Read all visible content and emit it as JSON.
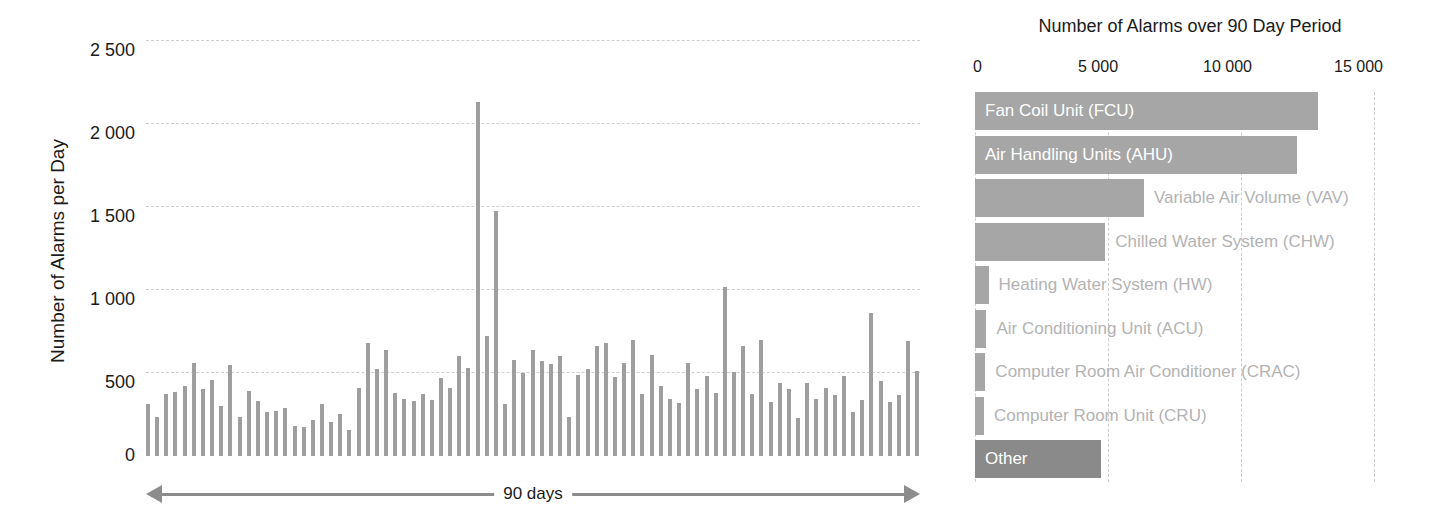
{
  "chart_data": [
    {
      "type": "bar",
      "id": "alarms-per-day",
      "title": "",
      "xlabel": "90 days",
      "ylabel": "Number of Alarms per Day",
      "ylim": [
        0,
        2500
      ],
      "yticks": [
        "0",
        "500",
        "1 000",
        "1 500",
        "2 000",
        "2 500"
      ],
      "ytick_values": [
        0,
        500,
        1000,
        1500,
        2000,
        2500
      ],
      "grid": "horizontal-dashed",
      "legend": "none",
      "bar_color": "#9e9e9e",
      "n_categories": 90,
      "categories": [
        "1",
        "2",
        "3",
        "4",
        "5",
        "6",
        "7",
        "8",
        "9",
        "10",
        "11",
        "12",
        "13",
        "14",
        "15",
        "16",
        "17",
        "18",
        "19",
        "20",
        "21",
        "22",
        "23",
        "24",
        "25",
        "26",
        "27",
        "28",
        "29",
        "30",
        "31",
        "32",
        "33",
        "34",
        "35",
        "36",
        "37",
        "38",
        "39",
        "40",
        "41",
        "42",
        "43",
        "44",
        "45",
        "46",
        "47",
        "48",
        "49",
        "50",
        "51",
        "52",
        "53",
        "54",
        "55",
        "56",
        "57",
        "58",
        "59",
        "60",
        "61",
        "62",
        "63",
        "64",
        "65",
        "66",
        "67",
        "68",
        "69",
        "70",
        "71",
        "72",
        "73",
        "74",
        "75",
        "76",
        "77",
        "78",
        "79",
        "80",
        "81",
        "82",
        "83",
        "84",
        "85",
        "86",
        "87",
        "88",
        "89",
        "90"
      ],
      "values": [
        310,
        235,
        370,
        385,
        420,
        560,
        400,
        455,
        300,
        545,
        235,
        390,
        330,
        265,
        270,
        290,
        180,
        175,
        215,
        310,
        205,
        255,
        155,
        410,
        680,
        520,
        640,
        380,
        345,
        330,
        370,
        335,
        470,
        410,
        600,
        530,
        2130,
        720,
        1470,
        315,
        575,
        500,
        640,
        570,
        555,
        600,
        235,
        485,
        520,
        660,
        680,
        475,
        560,
        700,
        370,
        610,
        420,
        345,
        320,
        560,
        400,
        480,
        380,
        1015,
        505,
        660,
        370,
        700,
        325,
        440,
        400,
        230,
        440,
        340,
        410,
        365,
        480,
        265,
        335,
        860,
        450,
        325,
        365,
        690,
        510
      ]
    },
    {
      "type": "bar",
      "id": "alarms-by-system",
      "orientation": "horizontal",
      "title": "Number of Alarms over 90 Day Period",
      "xlabel": "",
      "ylabel": "",
      "xlim": [
        0,
        15000
      ],
      "xticks": [
        "0",
        "5 000",
        "10 000",
        "15 000"
      ],
      "xtick_values": [
        0,
        5000,
        10000,
        15000
      ],
      "grid": "vertical-dashed",
      "legend": "none",
      "bar_color": "#a6a6a6",
      "highlight_color": "#8a8a8a",
      "categories": [
        "Fan Coil Unit (FCU)",
        "Air Handling Units (AHU)",
        "Variable Air Volume (VAV)",
        "Chilled Water System (CHW)",
        "Heating Water System (HW)",
        "Air Conditioning Unit (ACU)",
        "Computer Room Air Conditioner (CRAC)",
        "Computer Room Unit (CRU)",
        "Other"
      ],
      "values": [
        12900,
        12100,
        6350,
        4900,
        510,
        430,
        390,
        340,
        4750
      ],
      "label_placement": [
        "inside",
        "inside",
        "outside",
        "outside",
        "outside",
        "outside",
        "outside",
        "outside",
        "inside"
      ]
    }
  ]
}
